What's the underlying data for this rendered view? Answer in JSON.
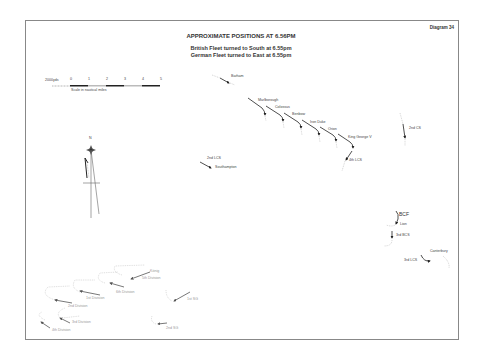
{
  "diagram": {
    "number_label": "Diagram 34",
    "title": "APPROXIMATE POSITIONS AT 6.56PM",
    "subtitle_lines": [
      "British Fleet turned to South at 6.55pm",
      "German Fleet turned to East at 6.55pm"
    ]
  },
  "scale": {
    "unit_label": "2000yds",
    "ticks": [
      "0",
      "1",
      "2",
      "3",
      "4",
      "5"
    ],
    "caption": "Scale in nautical miles"
  },
  "compass": {
    "north_label": "N"
  },
  "british": {
    "barham": "Barham",
    "battleships": [
      "Marlborough",
      "Colossus",
      "Benbow",
      "Iron Duke",
      "Orion",
      "King George V"
    ],
    "lcs4": "4th LCS",
    "cs2": "2nd CS",
    "lcs2": "2nd LCS",
    "southampton": "Southampton",
    "bcf": "BCF",
    "lion": "Lion",
    "bcs3": "3rd BCS",
    "lcs3": "3rd LCS",
    "canterbury": "Canterbury"
  },
  "german": {
    "konig": "König",
    "div5a": "5th Division",
    "div6": "6th Division",
    "div1": "1st Division",
    "div2": "2nd Division",
    "div3": "3rd Division",
    "div4": "4th Division",
    "sg1": "1st SG",
    "sg2": "2nd SG"
  },
  "colors": {
    "british_track": "#222222",
    "german_track": "#999999",
    "frame": "#888888"
  }
}
